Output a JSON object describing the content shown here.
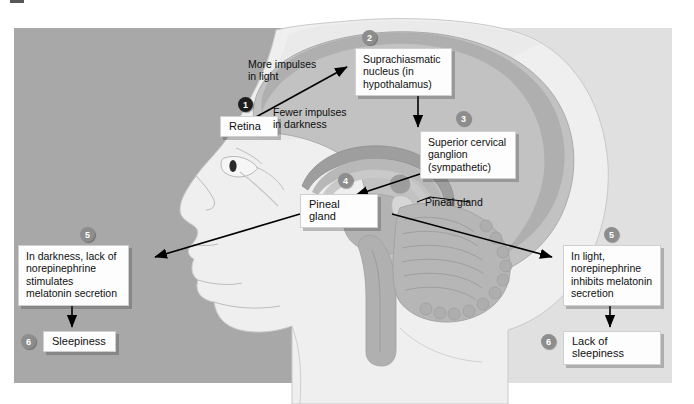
{
  "figure": {
    "panels": {
      "left_label": "darkness-panel",
      "right_label": "light-panel",
      "left_color": "#a8a8a8",
      "right_color": "#e0e0e0"
    }
  },
  "badges": [
    {
      "id": "1",
      "text": "1",
      "style": "dark"
    },
    {
      "id": "2",
      "text": "2",
      "style": "grey"
    },
    {
      "id": "3",
      "text": "3",
      "style": "grey"
    },
    {
      "id": "4",
      "text": "4",
      "style": "grey"
    },
    {
      "id": "5a",
      "text": "5",
      "style": "grey"
    },
    {
      "id": "5b",
      "text": "5",
      "style": "grey"
    },
    {
      "id": "6a",
      "text": "6",
      "style": "grey"
    },
    {
      "id": "6b",
      "text": "6",
      "style": "grey"
    }
  ],
  "boxes": {
    "retina": "Retina",
    "scn": "Suprachiasmatic nucleus (in hypothalamus)",
    "ganglion": "Superior cervical ganglion (sympathetic)",
    "pineal_box": "Pineal gland",
    "darkness_effect": "In darkness, lack of norepinephrine stimulates melatonin secretion",
    "light_effect": "In light, norepinephrine inhibits melatonin secretion",
    "sleepiness": "Sleepiness",
    "lack_of_sleepiness": "Lack of sleepiness"
  },
  "labels": {
    "more_impulses": "More impulses\nin light",
    "fewer_impulses": "Fewer impulses\nin darkness",
    "pineal_leader": "Pineal gland"
  },
  "colors": {
    "badge_dark": "#1d1d1d",
    "badge_grey": "#8d8d8d",
    "box_fill": "#fdfdfd",
    "arrow": "#000000",
    "skin": "#efefef",
    "brain": "#bdbdbd",
    "brain_mid": "#a9a9a9",
    "brain_dark": "#9a9a9a"
  }
}
